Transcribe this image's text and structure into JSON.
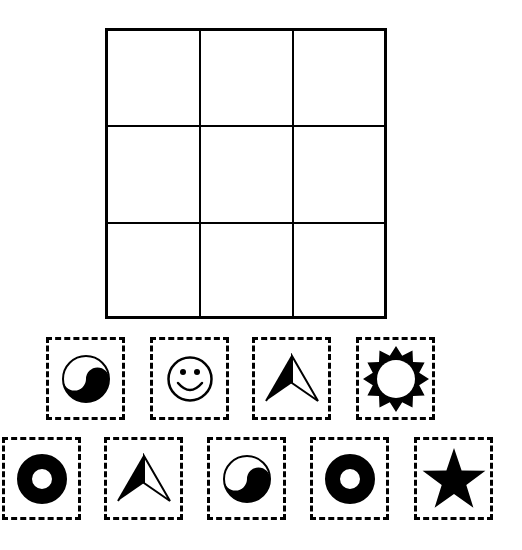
{
  "puzzle": {
    "board": {
      "rows": 3,
      "cols": 3,
      "cells": [
        {
          "row": 0,
          "col": 0,
          "symbol": ""
        },
        {
          "row": 0,
          "col": 1,
          "symbol": ""
        },
        {
          "row": 0,
          "col": 2,
          "symbol": ""
        },
        {
          "row": 1,
          "col": 0,
          "symbol": ""
        },
        {
          "row": 1,
          "col": 1,
          "symbol": ""
        },
        {
          "row": 1,
          "col": 2,
          "symbol": ""
        },
        {
          "row": 2,
          "col": 0,
          "symbol": ""
        },
        {
          "row": 2,
          "col": 1,
          "symbol": ""
        },
        {
          "row": 2,
          "col": 2,
          "symbol": ""
        }
      ]
    },
    "tiles": {
      "row1": [
        {
          "symbol": "yin-yang",
          "label": "yin-yang"
        },
        {
          "symbol": "smiley",
          "label": "smiley face"
        },
        {
          "symbol": "arrow",
          "label": "arrowhead"
        },
        {
          "symbol": "sun",
          "label": "sun"
        }
      ],
      "row2": [
        {
          "symbol": "ring",
          "label": "ring"
        },
        {
          "symbol": "arrow",
          "label": "arrowhead"
        },
        {
          "symbol": "yin-yang",
          "label": "yin-yang"
        },
        {
          "symbol": "ring",
          "label": "ring"
        },
        {
          "symbol": "star",
          "label": "star"
        }
      ]
    },
    "colors": {
      "ink": "#000000",
      "paper": "#ffffff"
    }
  }
}
